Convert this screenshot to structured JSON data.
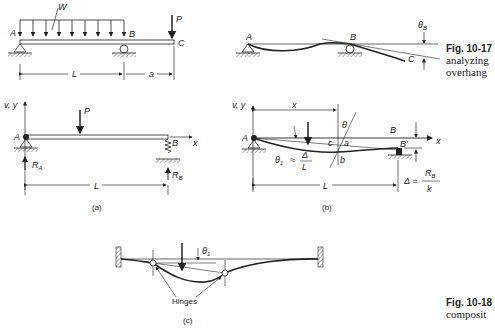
{
  "figure_10_17": {
    "caption_number": "Fig. 10-17",
    "caption_text_line1": "analyzing",
    "caption_text_line2": "overhang",
    "beam_loaded": {
      "labels": {
        "distributed_load": "W",
        "point_load": "P",
        "left_support": "A",
        "right_support": "B",
        "free_end": "C",
        "span": "L",
        "overhang": "a"
      }
    },
    "beam_deflected": {
      "labels": {
        "left_support": "A",
        "right_support": "B",
        "free_end": "C",
        "slope_angle": "θ",
        "slope_subscript": "B"
      }
    }
  },
  "figure_10_18": {
    "caption_number": "Fig. 10-18",
    "caption_text_line1": "composit",
    "panel_a": {
      "label": "(a)",
      "labels": {
        "axes": "v, y",
        "x_axis": "x",
        "load": "P",
        "left": "A",
        "right": "B",
        "reaction_left": "R",
        "reaction_left_sub": "A",
        "reaction_right": "R",
        "reaction_right_sub": "B",
        "span": "L"
      }
    },
    "panel_b": {
      "label": "(b)",
      "labels": {
        "axes": "v, y",
        "x_axis": "x",
        "distance": "x",
        "left": "A",
        "right": "B",
        "right_deflected": "B′",
        "angle": "θ",
        "point_c": "c",
        "point_a": "a",
        "point_b": "b",
        "theta1": "θ",
        "theta1_sub": "1",
        "approx": "≈",
        "delta": "Δ",
        "span_fraction_den": "L",
        "span": "L",
        "delta_eq": "Δ =",
        "rb": "R",
        "rb_sub": "B",
        "k": "k"
      }
    },
    "panel_c": {
      "label": "(c)",
      "labels": {
        "theta1": "θ",
        "theta1_sub": "1",
        "hinges": "Hinges"
      }
    }
  }
}
